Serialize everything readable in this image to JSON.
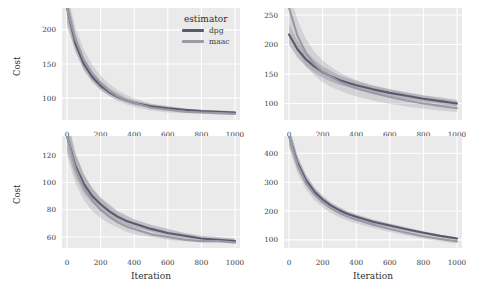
{
  "figure": {
    "background": "#ffffff",
    "panel_background": "#eaeaea",
    "grid_color": "#ffffff",
    "xlabel": "Iteration",
    "ylabel": "Cost"
  },
  "legend": {
    "title": "estimator",
    "entries": [
      {
        "label": "dpg",
        "color": "#5a5a6e"
      },
      {
        "label": "maac",
        "color": "#9a9aa6"
      }
    ]
  },
  "chart_data": [
    {
      "type": "line",
      "panel": "top-left",
      "title": "",
      "xlabel": "Iteration",
      "ylabel": "Cost",
      "xlim": [
        -30,
        1030
      ],
      "ylim": [
        68,
        232
      ],
      "xticks": [
        0,
        200,
        400,
        600,
        800,
        1000
      ],
      "yticks": [
        100,
        150,
        200
      ],
      "grid": true,
      "x": [
        0,
        50,
        100,
        150,
        200,
        250,
        300,
        350,
        400,
        500,
        600,
        700,
        800,
        900,
        1000
      ],
      "series": [
        {
          "name": "dpg",
          "color": "#5a5a6e",
          "values": [
            232,
            180,
            150,
            131,
            118,
            109,
            102,
            97,
            93,
            88,
            85,
            83,
            81,
            80,
            79
          ],
          "band_lower": [
            210,
            168,
            141,
            124,
            112,
            104,
            98,
            94,
            90,
            86,
            83,
            81,
            80,
            79,
            78
          ],
          "band_upper": [
            250,
            194,
            160,
            139,
            125,
            115,
            107,
            101,
            97,
            91,
            88,
            85,
            83,
            82,
            81
          ]
        },
        {
          "name": "maac",
          "color": "#9a9aa6",
          "values": [
            232,
            186,
            156,
            136,
            122,
            111,
            103,
            97,
            93,
            86,
            83,
            80,
            79,
            78,
            77
          ],
          "band_lower": [
            205,
            170,
            143,
            125,
            112,
            103,
            96,
            91,
            87,
            82,
            79,
            78,
            77,
            76,
            76
          ],
          "band_upper": [
            255,
            203,
            171,
            149,
            133,
            121,
            112,
            105,
            100,
            92,
            88,
            84,
            82,
            80,
            79
          ]
        }
      ]
    },
    {
      "type": "line",
      "panel": "top-right",
      "title": "",
      "xlabel": "Iteration",
      "ylabel": "",
      "xlim": [
        -30,
        1030
      ],
      "ylim": [
        72,
        262
      ],
      "xticks": [
        0,
        200,
        400,
        600,
        800,
        1000
      ],
      "yticks": [
        100,
        150,
        200,
        250
      ],
      "grid": true,
      "x": [
        0,
        50,
        100,
        150,
        200,
        250,
        300,
        350,
        400,
        500,
        600,
        700,
        800,
        900,
        1000
      ],
      "series": [
        {
          "name": "dpg",
          "color": "#5a5a6e",
          "values": [
            217,
            192,
            175,
            163,
            153,
            146,
            140,
            135,
            131,
            124,
            118,
            113,
            108,
            104,
            100
          ],
          "band_lower": [
            200,
            178,
            163,
            152,
            144,
            137,
            132,
            128,
            124,
            117,
            112,
            107,
            103,
            99,
            95
          ],
          "band_upper": [
            234,
            206,
            188,
            174,
            163,
            155,
            148,
            143,
            138,
            130,
            124,
            119,
            114,
            110,
            106
          ]
        },
        {
          "name": "maac",
          "color": "#9a9aa6",
          "values": [
            262,
            215,
            186,
            167,
            154,
            145,
            137,
            131,
            126,
            118,
            111,
            105,
            100,
            96,
            92
          ],
          "band_lower": [
            232,
            190,
            164,
            148,
            136,
            128,
            122,
            117,
            112,
            105,
            99,
            95,
            91,
            88,
            85
          ],
          "band_upper": [
            292,
            242,
            210,
            188,
            173,
            162,
            153,
            146,
            140,
            131,
            124,
            118,
            113,
            108,
            104
          ]
        }
      ]
    },
    {
      "type": "line",
      "panel": "bottom-left",
      "title": "",
      "xlabel": "Iteration",
      "ylabel": "Cost",
      "xlim": [
        -30,
        1030
      ],
      "ylim": [
        52,
        134
      ],
      "xticks": [
        0,
        200,
        400,
        600,
        800,
        1000
      ],
      "yticks": [
        60,
        80,
        100,
        120
      ],
      "grid": true,
      "x": [
        0,
        50,
        100,
        150,
        200,
        250,
        300,
        350,
        400,
        500,
        600,
        700,
        800,
        900,
        1000
      ],
      "series": [
        {
          "name": "dpg",
          "color": "#5a5a6e",
          "values": [
            134,
            112,
            99,
            90,
            84,
            79,
            75,
            72,
            70,
            66,
            63,
            61,
            59,
            58,
            57
          ],
          "band_lower": [
            123,
            104,
            92,
            85,
            79,
            75,
            72,
            69,
            67,
            64,
            61,
            59,
            58,
            57,
            56
          ],
          "band_upper": [
            145,
            121,
            106,
            96,
            89,
            84,
            79,
            76,
            73,
            69,
            66,
            63,
            61,
            60,
            59
          ]
        },
        {
          "name": "maac",
          "color": "#9a9aa6",
          "values": [
            134,
            110,
            96,
            87,
            80,
            75,
            71,
            68,
            66,
            62,
            60,
            58,
            57,
            57,
            56
          ],
          "band_lower": [
            120,
            99,
            87,
            79,
            74,
            70,
            67,
            64,
            62,
            60,
            58,
            57,
            56,
            56,
            55
          ],
          "band_upper": [
            148,
            122,
            106,
            96,
            88,
            82,
            77,
            73,
            70,
            65,
            62,
            60,
            58,
            58,
            57
          ]
        }
      ]
    },
    {
      "type": "line",
      "panel": "bottom-right",
      "title": "",
      "xlabel": "Iteration",
      "ylabel": "",
      "xlim": [
        -30,
        1030
      ],
      "ylim": [
        72,
        460
      ],
      "xticks": [
        0,
        200,
        400,
        600,
        800,
        1000
      ],
      "yticks": [
        100,
        200,
        300,
        400
      ],
      "grid": true,
      "x": [
        0,
        50,
        100,
        150,
        200,
        250,
        300,
        350,
        400,
        500,
        600,
        700,
        800,
        900,
        1000
      ],
      "series": [
        {
          "name": "dpg",
          "color": "#5a5a6e",
          "values": [
            460,
            368,
            308,
            268,
            240,
            219,
            203,
            190,
            180,
            163,
            150,
            137,
            125,
            114,
            105
          ],
          "band_lower": [
            428,
            344,
            289,
            253,
            227,
            208,
            193,
            181,
            171,
            155,
            143,
            131,
            120,
            110,
            101
          ],
          "band_upper": [
            492,
            392,
            327,
            283,
            253,
            230,
            213,
            199,
            189,
            171,
            157,
            143,
            130,
            118,
            109
          ]
        },
        {
          "name": "maac",
          "color": "#9a9aa6",
          "values": [
            460,
            360,
            298,
            258,
            230,
            209,
            193,
            180,
            170,
            153,
            138,
            125,
            113,
            103,
            95
          ],
          "band_lower": [
            420,
            331,
            275,
            238,
            212,
            193,
            178,
            166,
            157,
            141,
            127,
            115,
            104,
            95,
            88
          ],
          "band_upper": [
            500,
            389,
            321,
            278,
            248,
            225,
            208,
            194,
            183,
            165,
            149,
            135,
            122,
            111,
            102
          ]
        }
      ]
    }
  ]
}
